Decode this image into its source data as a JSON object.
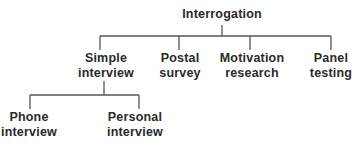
{
  "diagram": {
    "type": "tree",
    "root": {
      "label": "Interrogation",
      "children": [
        {
          "label_lines": [
            "Simple",
            "interview"
          ],
          "children": [
            {
              "label_lines": [
                "Phone",
                "interview"
              ]
            },
            {
              "label_lines": [
                "Personal",
                "interview"
              ]
            }
          ]
        },
        {
          "label_lines": [
            "Postal",
            "survey"
          ]
        },
        {
          "label_lines": [
            "Motivation",
            "research"
          ]
        },
        {
          "label_lines": [
            "Panel",
            "testing"
          ]
        }
      ]
    },
    "line_color": "#555555",
    "text_color": "#2a2a2a"
  }
}
